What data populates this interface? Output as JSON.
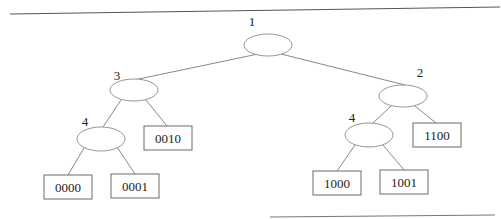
{
  "diagram": {
    "type": "binary-trie",
    "internal_nodes": [
      {
        "id": "n1",
        "label": "1",
        "cx": 268,
        "cy": 45,
        "lx": 252,
        "ly": 26
      },
      {
        "id": "n3",
        "label": "3",
        "cx": 134,
        "cy": 90,
        "lx": 117,
        "ly": 79
      },
      {
        "id": "n2",
        "label": "2",
        "cx": 403,
        "cy": 96,
        "lx": 420,
        "ly": 76
      },
      {
        "id": "n4a",
        "label": "4",
        "cx": 101,
        "cy": 139,
        "lx": 85,
        "ly": 126
      },
      {
        "id": "n4b",
        "label": "4",
        "cx": 369,
        "cy": 135,
        "lx": 352,
        "ly": 122
      }
    ],
    "leaves": [
      {
        "id": "l0010",
        "label": "0010",
        "x": 144,
        "y": 126,
        "w": 48,
        "h": 24
      },
      {
        "id": "l0000",
        "label": "0000",
        "x": 44,
        "y": 175,
        "w": 48,
        "h": 24
      },
      {
        "id": "l0001",
        "label": "0001",
        "x": 111,
        "y": 174,
        "w": 48,
        "h": 24
      },
      {
        "id": "l1100",
        "label": "1100",
        "x": 413,
        "y": 123,
        "w": 48,
        "h": 24
      },
      {
        "id": "l1000",
        "label": "1000",
        "x": 313,
        "y": 171,
        "w": 48,
        "h": 24
      },
      {
        "id": "l1001",
        "label": "1001",
        "x": 380,
        "y": 170,
        "w": 48,
        "h": 24
      }
    ],
    "edges": [
      {
        "from": "n1",
        "to": "n3"
      },
      {
        "from": "n1",
        "to": "n2"
      },
      {
        "from": "n3",
        "to": "n4a"
      },
      {
        "from": "n3",
        "to": "l0010"
      },
      {
        "from": "n4a",
        "to": "l0000"
      },
      {
        "from": "n4a",
        "to": "l0001"
      },
      {
        "from": "n2",
        "to": "n4b"
      },
      {
        "from": "n2",
        "to": "l1100"
      },
      {
        "from": "n4b",
        "to": "l1000"
      },
      {
        "from": "n4b",
        "to": "l1001"
      }
    ]
  }
}
